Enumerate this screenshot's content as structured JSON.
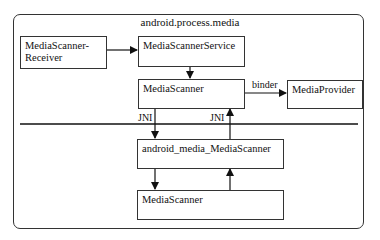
{
  "diagram": {
    "container_title": "android.process.media",
    "boxes": {
      "receiver": "MediaScanner-Receiver",
      "receiver_line1": "MediaScanner-",
      "receiver_line2": "Receiver",
      "service": "MediaScannerService",
      "scanner_java": "MediaScanner",
      "provider": "MediaProvider",
      "jni_bridge": "android_media_MediaScanner",
      "scanner_native": "MediaScanner"
    },
    "edge_labels": {
      "binder": "binder",
      "jni_down": "JNI",
      "jni_up": "JNI"
    },
    "edges": [
      {
        "from": "receiver",
        "to": "service",
        "label": ""
      },
      {
        "from": "service",
        "to": "scanner_java",
        "label": ""
      },
      {
        "from": "scanner_java",
        "to": "provider",
        "label": "binder"
      },
      {
        "from": "scanner_java",
        "to": "jni_bridge",
        "label": "JNI"
      },
      {
        "from": "jni_bridge",
        "to": "scanner_java",
        "label": "JNI"
      },
      {
        "from": "jni_bridge",
        "to": "scanner_native",
        "label": ""
      },
      {
        "from": "scanner_native",
        "to": "jni_bridge",
        "label": ""
      }
    ]
  }
}
